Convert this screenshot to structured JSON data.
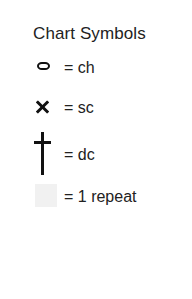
{
  "legend": {
    "title": "Chart Symbols",
    "rows": [
      {
        "symbol": "chain-stitch-oval",
        "label": "= ch"
      },
      {
        "symbol": "single-crochet-x",
        "label": "= sc"
      },
      {
        "symbol": "double-crochet-dagger",
        "label": "= dc"
      },
      {
        "symbol": "repeat-swatch-square",
        "label": "= 1 repeat"
      }
    ]
  },
  "colors": {
    "background": "#ffffff",
    "ink": "#222222",
    "symbol": "#111111",
    "repeat_swatch": "#f1f1f1"
  }
}
